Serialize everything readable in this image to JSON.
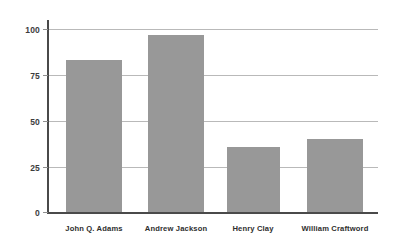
{
  "chart_data": {
    "type": "bar",
    "title": "",
    "subtitle": "",
    "xlabel": "",
    "ylabel": "",
    "categories": [
      "John Q. Adams",
      "Andrew Jackson",
      "Henry Clay",
      "William Craftword"
    ],
    "values": [
      83,
      97,
      36,
      40
    ],
    "series": [
      {
        "name": "",
        "values": [
          83,
          97,
          36,
          40
        ]
      }
    ],
    "ylim": [
      0,
      100
    ],
    "yticks": [
      0,
      25,
      50,
      75,
      100
    ],
    "ytick_labels": [
      "0",
      "25",
      "50",
      "75",
      "100"
    ],
    "grid": true,
    "grid_axis": "y",
    "legend": false,
    "legend_position": "none",
    "bar_color": "#989898",
    "gridline_color": "#b9b9b9",
    "axis_color": "#4a4a4a",
    "background_color": "#ffffff",
    "annotations": []
  },
  "axis": {
    "y_tick_0": "0",
    "y_tick_1": "25",
    "y_tick_2": "50",
    "y_tick_3": "75",
    "y_tick_4": "100"
  },
  "categories": {
    "cat_0": "John Q. Adams",
    "cat_1": "Andrew Jackson",
    "cat_2": "Henry Clay",
    "cat_3": "William Craftword"
  }
}
